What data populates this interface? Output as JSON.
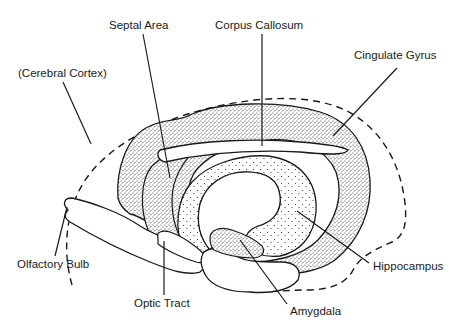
{
  "diagram": {
    "colors": {
      "line": "#1a1a1a",
      "stipple": "#2a2a2a",
      "background": "#ffffff"
    },
    "labels": {
      "septal_area": "Septal Area",
      "corpus_callosum": "Corpus Callosum",
      "cingulate_gyrus": "Cingulate Gyrus",
      "cerebral_cortex": "(Cerebral Cortex)",
      "olfactory_bulb": "Olfactory Bulb",
      "optic_tract": "Optic Tract",
      "amygdala": "Amygdala",
      "hippocampus": "Hippocampus"
    }
  }
}
